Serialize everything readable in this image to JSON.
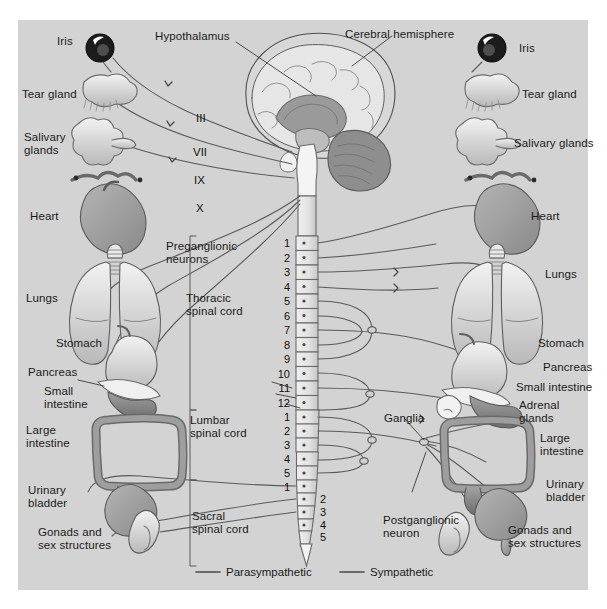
{
  "figure": {
    "domain": "anatomy-diagram",
    "panel_bg": "#d3d3d3",
    "page_bg": "#ffffff",
    "ink": "#4a4a4a"
  },
  "central": {
    "brain_label": "Cerebral hemisphere",
    "hypothalamus_label": "Hypothalamus",
    "cranial_nerves": [
      "III",
      "VII",
      "IX",
      "X"
    ],
    "preganglionic_label": "Preganglionic\nneurons",
    "cord_regions": [
      {
        "name": "Thoracic\nspinal cord",
        "segments": [
          "1",
          "2",
          "3",
          "4",
          "5",
          "6",
          "7",
          "8",
          "9",
          "10",
          "11",
          "12"
        ]
      },
      {
        "name": "Lumbar\nspinal cord",
        "segments": [
          "1",
          "2",
          "3",
          "4",
          "5"
        ]
      },
      {
        "name": "Sacral\nspinal cord",
        "segments": [
          "1",
          "2",
          "3",
          "4",
          "5"
        ]
      }
    ]
  },
  "left_organs": [
    {
      "name": "Iris"
    },
    {
      "name": "Tear gland"
    },
    {
      "name": "Salivary\nglands"
    },
    {
      "name": "Heart"
    },
    {
      "name": "Lungs"
    },
    {
      "name": "Stomach"
    },
    {
      "name": "Pancreas"
    },
    {
      "name": "Small\nintestine"
    },
    {
      "name": "Large\nintestine"
    },
    {
      "name": "Urinary\nbladder"
    },
    {
      "name": "Gonads and\nsex structures"
    }
  ],
  "right_organs": [
    {
      "name": "Iris"
    },
    {
      "name": "Tear gland"
    },
    {
      "name": "Salivary glands"
    },
    {
      "name": "Heart"
    },
    {
      "name": "Lungs"
    },
    {
      "name": "Stomach"
    },
    {
      "name": "Pancreas"
    },
    {
      "name": "Small intestine"
    },
    {
      "name": "Adrenal\nglands"
    },
    {
      "name": "Large\nintestine"
    },
    {
      "name": "Urinary\nbladder"
    },
    {
      "name": "Gonads and\nsex structures"
    }
  ],
  "right_annotations": {
    "ganglia": "Ganglia",
    "postganglionic": "Postganglionic\nneuron"
  },
  "legend": {
    "items": [
      {
        "label": "Parasympathetic",
        "color": "#4a4a4a"
      },
      {
        "label": "Sympathetic",
        "color": "#4a4a4a"
      }
    ]
  }
}
